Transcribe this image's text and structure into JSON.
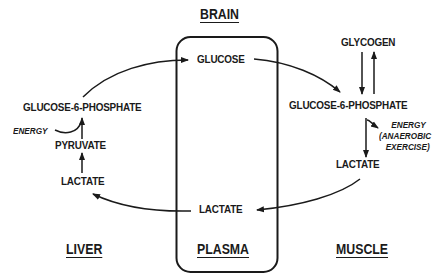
{
  "diagram": {
    "type": "metabolic-pathway",
    "regions": {
      "brain": "BRAIN",
      "plasma": "PLASMA",
      "liver": "LIVER",
      "muscle": "MUSCLE"
    },
    "plasma": {
      "glucose": "GLUCOSE",
      "lactate": "LACTATE"
    },
    "liver": {
      "g6p": "GLUCOSE-6-PHOSPHATE",
      "pyruvate": "PYRUVATE",
      "lactate": "LACTATE",
      "energy": "ENERGY"
    },
    "muscle": {
      "glycogen": "GLYCOGEN",
      "g6p": "GLUCOSE-6-PHOSPHATE",
      "lactate": "LACTATE",
      "energy_line1": "ENERGY",
      "energy_line2": "(ANAEROBIC",
      "energy_line3": "EXERCISE)"
    },
    "edges": [
      {
        "from": "liver.g6p",
        "to": "plasma.glucose"
      },
      {
        "from": "plasma.glucose",
        "to": "muscle.g6p"
      },
      {
        "from": "muscle.glycogen",
        "to": "muscle.g6p"
      },
      {
        "from": "muscle.g6p",
        "to": "muscle.glycogen"
      },
      {
        "from": "muscle.g6p",
        "to": "muscle.lactate",
        "output": "muscle.energy"
      },
      {
        "from": "muscle.lactate",
        "to": "plasma.lactate"
      },
      {
        "from": "plasma.lactate",
        "to": "liver.lactate"
      },
      {
        "from": "liver.lactate",
        "to": "liver.pyruvate"
      },
      {
        "from": "liver.pyruvate",
        "to": "liver.g6p",
        "input": "liver.energy"
      }
    ]
  }
}
